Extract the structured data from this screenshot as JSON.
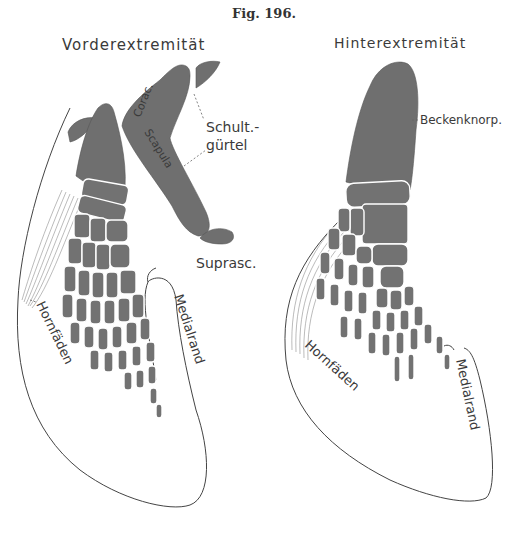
{
  "figure": {
    "title": "Fig. 196.",
    "left_panel": {
      "heading": "Vorderextremität",
      "labels": {
        "schultguertel_line1": "Schult.-",
        "schultguertel_line2": "gürtel",
        "coracoid": "Corac.",
        "scapula": "Scapula",
        "suprascapula": "Suprasc.",
        "hornfaeden": "Hornfäden",
        "medialrand": "Medialrand"
      }
    },
    "right_panel": {
      "heading": "Hinterextremität",
      "labels": {
        "beckenknorpel": "Beckenknorp.",
        "hornfaeden": "Hornfäden",
        "medialrand": "Medialrand"
      }
    },
    "colors": {
      "cartilage": "#6f6f6f",
      "outline": "#444444",
      "text": "#3a3a3a",
      "background": "#ffffff"
    }
  }
}
